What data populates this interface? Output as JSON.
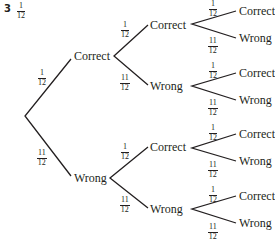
{
  "question": {
    "number": "3",
    "answer": {
      "num": "1",
      "den": "12"
    }
  },
  "tree": {
    "level1": [
      {
        "label": "Correct",
        "prob": {
          "num": "1",
          "den": "12"
        }
      },
      {
        "label": "Wrong",
        "prob": {
          "num": "11",
          "den": "12"
        }
      }
    ],
    "level2": [
      {
        "label": "Correct",
        "prob": {
          "num": "1",
          "den": "12"
        }
      },
      {
        "label": "Wrong",
        "prob": {
          "num": "11",
          "den": "12"
        }
      },
      {
        "label": "Correct",
        "prob": {
          "num": "1",
          "den": "12"
        }
      },
      {
        "label": "Wrong",
        "prob": {
          "num": "11",
          "den": "12"
        }
      }
    ],
    "level3": [
      {
        "label": "Correct",
        "prob": {
          "num": "1",
          "den": "12"
        }
      },
      {
        "label": "Wrong",
        "prob": {
          "num": "11",
          "den": "12"
        }
      },
      {
        "label": "Correct",
        "prob": {
          "num": "1",
          "den": "12"
        }
      },
      {
        "label": "Wrong",
        "prob": {
          "num": "11",
          "den": "12"
        }
      },
      {
        "label": "Correct",
        "prob": {
          "num": "1",
          "den": "12"
        }
      },
      {
        "label": "Wrong",
        "prob": {
          "num": "11",
          "den": "12"
        }
      },
      {
        "label": "Correct",
        "prob": {
          "num": "1",
          "den": "12"
        }
      },
      {
        "label": "Wrong",
        "prob": {
          "num": "11",
          "den": "12"
        }
      }
    ]
  }
}
